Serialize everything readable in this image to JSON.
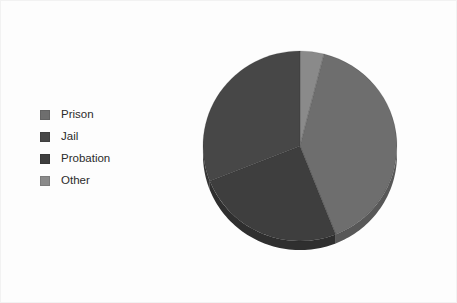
{
  "canvas": {
    "width": 457,
    "height": 303,
    "background": "#fdfdfd",
    "border_color": "#f2f2f2"
  },
  "legend": {
    "position": "left",
    "items": [
      {
        "label": "Prison",
        "color": "#6e6e6e"
      },
      {
        "label": "Jail",
        "color": "#474747"
      },
      {
        "label": "Probation",
        "color": "#3e3e3e"
      },
      {
        "label": "Other",
        "color": "#8a8a8a"
      }
    ]
  },
  "chart_data": {
    "type": "pie",
    "title": "",
    "subtitle": "",
    "xlabel": "",
    "ylabel": "",
    "grid": false,
    "legend_position": "left",
    "three_d": true,
    "start_angle_deg": 0,
    "direction": "clockwise",
    "categories": [
      "Other",
      "Prison",
      "Probation",
      "Jail"
    ],
    "values": [
      4,
      40,
      25,
      31
    ],
    "units": "percent",
    "slices": [
      {
        "label": "Other",
        "value": 4,
        "color": "#8a8a8a",
        "side_color": "#6f6f6f"
      },
      {
        "label": "Prison",
        "value": 40,
        "color": "#6e6e6e",
        "side_color": "#585858"
      },
      {
        "label": "Probation",
        "value": 25,
        "color": "#3e3e3e",
        "side_color": "#2f2f2f"
      },
      {
        "label": "Jail",
        "value": 31,
        "color": "#474747",
        "side_color": "#363636"
      }
    ],
    "annotations": []
  },
  "geometry": {
    "center_x": 99,
    "center_y": 112,
    "radius_x": 97,
    "radius_y": 97,
    "depth": 9,
    "squash": 0.98
  }
}
